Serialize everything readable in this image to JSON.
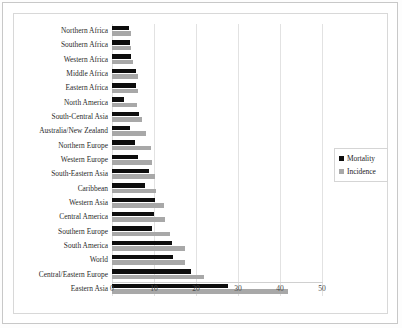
{
  "chart_data": {
    "type": "bar",
    "orientation": "horizontal",
    "title": "",
    "subtitle": "",
    "xlabel": "",
    "ylabel": "",
    "xlim": [
      0,
      50
    ],
    "xticks": [
      0,
      10,
      20,
      30,
      40,
      50
    ],
    "xtick_labels": [
      "0",
      "10",
      "20",
      "30",
      "40",
      "50"
    ],
    "grid": true,
    "grid_axis": "x",
    "legend_position": "center-right",
    "categories": [
      "Northern Africa",
      "Southern Africa",
      "Western Africa",
      "Middle Africa",
      "Eastern Africa",
      "North America",
      "South-Central Asia",
      "Australia/New Zealand",
      "Northern Europe",
      "Western Europe",
      "South-Eastern Asia",
      "Caribbean",
      "Western Asia",
      "Central America",
      "Southern Europe",
      "South America",
      "World",
      "Central/Eastern Europe",
      "Eastern Asia"
    ],
    "series": [
      {
        "name": "Mortality",
        "color": "#0d0d0d",
        "values": [
          4.0,
          4.2,
          4.6,
          5.6,
          5.6,
          2.8,
          6.4,
          4.2,
          5.5,
          6.2,
          8.7,
          7.9,
          10.3,
          9.9,
          9.5,
          14.4,
          14.5,
          18.8,
          27.6
        ]
      },
      {
        "name": "Incidence",
        "color": "#a8a8a8",
        "values": [
          4.5,
          4.6,
          5.0,
          6.2,
          6.3,
          6.0,
          7.1,
          8.0,
          9.4,
          9.6,
          10.2,
          10.4,
          12.4,
          12.6,
          13.8,
          17.4,
          17.4,
          21.9,
          41.8
        ]
      }
    ]
  },
  "legend": {
    "items": [
      {
        "label": "Mortality",
        "color": "#0d0d0d"
      },
      {
        "label": "Incidence",
        "color": "#a8a8a8"
      }
    ]
  }
}
